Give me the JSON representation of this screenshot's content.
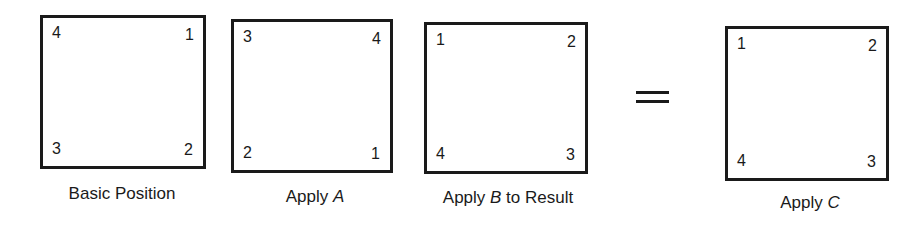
{
  "diagram": {
    "panels": [
      {
        "id": "basic",
        "caption_prefix": "Basic Position",
        "caption_var": "",
        "caption_suffix": "",
        "corners": {
          "top_left": "4",
          "top_right": "1",
          "bottom_left": "3",
          "bottom_right": "2"
        }
      },
      {
        "id": "apply-a",
        "caption_prefix": "Apply ",
        "caption_var": "A",
        "caption_suffix": "",
        "corners": {
          "top_left": "3",
          "top_right": "4",
          "bottom_left": "2",
          "bottom_right": "1"
        }
      },
      {
        "id": "apply-b",
        "caption_prefix": "Apply ",
        "caption_var": "B",
        "caption_suffix": " to Result",
        "corners": {
          "top_left": "1",
          "top_right": "2",
          "bottom_left": "4",
          "bottom_right": "3"
        }
      },
      {
        "id": "apply-c",
        "caption_prefix": "Apply ",
        "caption_var": "C",
        "caption_suffix": "",
        "corners": {
          "top_left": "1",
          "top_right": "2",
          "bottom_left": "4",
          "bottom_right": "3"
        }
      }
    ],
    "operator": "="
  }
}
